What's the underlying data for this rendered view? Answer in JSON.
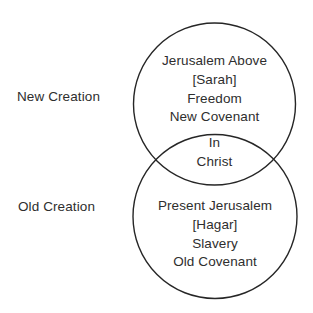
{
  "diagram": {
    "type": "venn-2-circle-vertical",
    "side_labels": [
      "New Creation",
      "Old Creation"
    ],
    "top_circle_lines": [
      "Jerusalem Above",
      "[Sarah]",
      "Freedom",
      "New Covenant"
    ],
    "intersection_lines": [
      "In",
      "Christ"
    ],
    "bottom_circle_lines": [
      "Present Jerusalem",
      "[Hagar]",
      "Slavery",
      "Old Covenant"
    ],
    "colors": {
      "background": "#ffffff",
      "stroke": "#262626",
      "text": "#2e2e2e"
    }
  }
}
